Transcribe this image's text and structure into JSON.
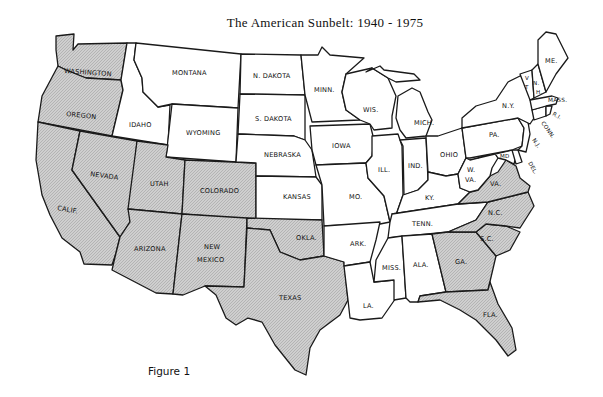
{
  "title": "The American Sunbelt: 1940 - 1975",
  "caption": "Figure 1",
  "legend": {
    "shaded_meaning": "Sunbelt states",
    "shade_color": "#c8c8c8",
    "unshaded_color": "#ffffff"
  },
  "states": {
    "WA": {
      "label": "WASHINGTON",
      "sunbelt": true
    },
    "OR": {
      "label": "OREGON",
      "sunbelt": true
    },
    "CA": {
      "label": "CALIF.",
      "sunbelt": true
    },
    "NV": {
      "label": "NEVADA",
      "sunbelt": true
    },
    "ID": {
      "label": "IDAHO",
      "sunbelt": false
    },
    "MT": {
      "label": "MONTANA",
      "sunbelt": false
    },
    "WY": {
      "label": "WYOMING",
      "sunbelt": false
    },
    "UT": {
      "label": "UTAH",
      "sunbelt": true
    },
    "CO": {
      "label": "COLORADO",
      "sunbelt": true
    },
    "AZ": {
      "label": "ARIZONA",
      "sunbelt": true
    },
    "NM1": {
      "label": "NEW",
      "sunbelt": true
    },
    "NM2": {
      "label": "MEXICO",
      "sunbelt": true
    },
    "ND": {
      "label": "N. DAKOTA",
      "sunbelt": false
    },
    "SD": {
      "label": "S. DAKOTA",
      "sunbelt": false
    },
    "NE": {
      "label": "NEBRASKA",
      "sunbelt": false
    },
    "KS": {
      "label": "KANSAS",
      "sunbelt": false
    },
    "OK": {
      "label": "OKLA.",
      "sunbelt": true
    },
    "TX": {
      "label": "TEXAS",
      "sunbelt": true
    },
    "MN": {
      "label": "MINN.",
      "sunbelt": false
    },
    "IA": {
      "label": "IOWA",
      "sunbelt": false
    },
    "MO": {
      "label": "MO.",
      "sunbelt": false
    },
    "AR": {
      "label": "ARK.",
      "sunbelt": false
    },
    "LA": {
      "label": "LA.",
      "sunbelt": false
    },
    "WI": {
      "label": "WIS.",
      "sunbelt": false
    },
    "IL": {
      "label": "ILL.",
      "sunbelt": false
    },
    "MI": {
      "label": "MICH.",
      "sunbelt": false
    },
    "IN": {
      "label": "IND.",
      "sunbelt": false
    },
    "OH": {
      "label": "OHIO",
      "sunbelt": false
    },
    "KY": {
      "label": "KY.",
      "sunbelt": false
    },
    "TN": {
      "label": "TENN.",
      "sunbelt": false
    },
    "MS": {
      "label": "MISS.",
      "sunbelt": false
    },
    "AL": {
      "label": "ALA.",
      "sunbelt": false
    },
    "GA": {
      "label": "GA.",
      "sunbelt": true
    },
    "FL": {
      "label": "FLA.",
      "sunbelt": true
    },
    "SC": {
      "label": "S.C.",
      "sunbelt": true
    },
    "NC": {
      "label": "N.C.",
      "sunbelt": true
    },
    "VA": {
      "label": "VA.",
      "sunbelt": true
    },
    "WV1": {
      "label": "W.",
      "sunbelt": false
    },
    "WV2": {
      "label": "VA.",
      "sunbelt": false
    },
    "MD": {
      "label": "MD",
      "sunbelt": false
    },
    "DE": {
      "label": "DEL.",
      "sunbelt": false
    },
    "PA": {
      "label": "PA.",
      "sunbelt": false
    },
    "NJ": {
      "label": "N.J.",
      "sunbelt": false
    },
    "NY": {
      "label": "N.Y.",
      "sunbelt": false
    },
    "CT": {
      "label": "CONN.",
      "sunbelt": false
    },
    "RI": {
      "label": "R.I.",
      "sunbelt": false
    },
    "MA": {
      "label": "MASS.",
      "sunbelt": false
    },
    "VT1": {
      "label": "V",
      "sunbelt": false
    },
    "VT2": {
      "label": "T",
      "sunbelt": false
    },
    "NH1": {
      "label": "N.",
      "sunbelt": false
    },
    "NH2": {
      "label": "H.",
      "sunbelt": false
    },
    "ME": {
      "label": "ME.",
      "sunbelt": false
    }
  }
}
